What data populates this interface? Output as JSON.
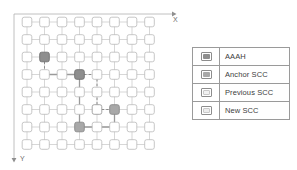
{
  "diagram": {
    "axes": {
      "x_label": "X",
      "y_label": "Y",
      "x_direction": "right",
      "y_direction": "down"
    },
    "grid": {
      "rows": 8,
      "cols": 8,
      "node_shape": "rounded-square",
      "node_fill_default": "#ffffff",
      "node_stroke_default": "#b9b9b9",
      "link_color": "#c2c2c2"
    },
    "colors": {
      "aaah": "#8e8e8e",
      "anchor_scc": "#a8a8a8",
      "previous_scc": "#ffffff",
      "new_scc": "#ffffff",
      "node_outline": "#b9b9b9",
      "path_solid": "#9a9a9a",
      "path_dashed": "#8c8c8c",
      "frame": "#cfcfcf"
    },
    "highlighted_nodes": [
      {
        "id": "aaah-node",
        "col": 1,
        "row": 2,
        "role": "AAAH",
        "fill": "#8e8e8e"
      },
      {
        "id": "anchor-scc-node",
        "col": 3,
        "row": 3,
        "role": "Anchor SCC",
        "fill": "#8e8e8e"
      },
      {
        "id": "previous-scc-node",
        "col": 4,
        "row": 5,
        "role": "Previous SCC",
        "fill": "#ffffff"
      },
      {
        "id": "new-scc-node",
        "col": 5,
        "row": 5,
        "role": "New SCC",
        "fill": "#a8a8a8"
      },
      {
        "id": "scc-node-bottom",
        "col": 4,
        "row": 6,
        "role": "Anchor SCC",
        "fill": "#a8a8a8"
      }
    ],
    "path_segments": [
      {
        "id": "seg-aaah-down",
        "style": "dashed",
        "from": [
          1,
          2
        ],
        "to": [
          1,
          3
        ],
        "arrow": true
      },
      {
        "id": "seg-aaah-right",
        "style": "solid",
        "from": [
          1,
          3
        ],
        "to": [
          3,
          3
        ],
        "arrow": true
      },
      {
        "id": "seg-anchor-right",
        "style": "dashed",
        "from": [
          3,
          3
        ],
        "to": [
          4,
          3
        ],
        "arrow": true
      },
      {
        "id": "seg-prev-down",
        "style": "dashed",
        "from": [
          4,
          3
        ],
        "to": [
          4,
          5
        ],
        "arrow": true
      },
      {
        "id": "seg-prev-right",
        "style": "dashed",
        "from": [
          4,
          5
        ],
        "to": [
          5,
          5
        ],
        "arrow": true
      },
      {
        "id": "seg-new-down",
        "style": "solid",
        "from": [
          5,
          5
        ],
        "to": [
          5,
          6
        ],
        "arrow": true
      },
      {
        "id": "seg-bottom-left",
        "style": "solid",
        "from": [
          5,
          6
        ],
        "to": [
          3,
          6
        ],
        "arrow": true
      },
      {
        "id": "seg-anchor-down",
        "style": "solid",
        "from": [
          3,
          3
        ],
        "to": [
          3,
          6
        ],
        "arrow": true
      }
    ]
  },
  "legend": {
    "title": "Legend",
    "items": [
      {
        "label": "AAAH",
        "swatch_fill": "#8e8e8e",
        "swatch_border": "#8d8d8d"
      },
      {
        "label": "Anchor SCC",
        "swatch_fill": "#a8a8a8",
        "swatch_border": "#8d8d8d"
      },
      {
        "label": "Previous SCC",
        "swatch_fill": "#f2f2f2",
        "swatch_border": "#8d8d8d"
      },
      {
        "label": "New SCC",
        "swatch_fill": "#ececec",
        "swatch_border": "#8d8d8d"
      }
    ]
  }
}
